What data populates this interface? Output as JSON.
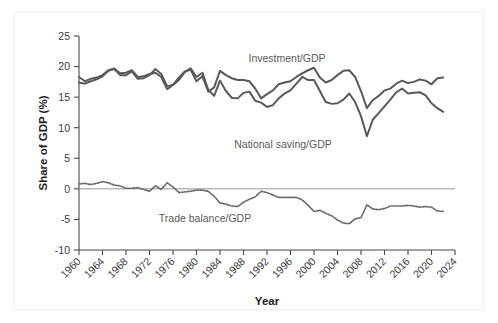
{
  "chart_data": {
    "type": "line",
    "title": "",
    "xlabel": "Year",
    "ylabel": "Share of GDP (%)",
    "xlim": [
      1960,
      2024
    ],
    "ylim": [
      -10,
      25
    ],
    "yticks": [
      -10,
      -5,
      0,
      5,
      10,
      15,
      20,
      25
    ],
    "ytick_labels": [
      "-10",
      "-5",
      "0",
      "5",
      "10",
      "15",
      "20",
      "25"
    ],
    "xticks": [
      1960,
      1964,
      1968,
      1972,
      1976,
      1980,
      1984,
      1988,
      1992,
      1996,
      2000,
      2004,
      2008,
      2012,
      2016,
      2020,
      2024
    ],
    "xtick_labels": [
      "1960",
      "1964",
      "1968",
      "1972",
      "1976",
      "1980",
      "1984",
      "1988",
      "1992",
      "1996",
      "2000",
      "2004",
      "2008",
      "2012",
      "2016",
      "2020",
      "2024"
    ],
    "grid": false,
    "legend": "inline-annotations",
    "zero_reference_line": 0,
    "x": [
      1960,
      1961,
      1962,
      1963,
      1964,
      1965,
      1966,
      1967,
      1968,
      1969,
      1970,
      1971,
      1972,
      1973,
      1974,
      1975,
      1976,
      1977,
      1978,
      1979,
      1980,
      1981,
      1982,
      1983,
      1984,
      1985,
      1986,
      1987,
      1988,
      1989,
      1990,
      1991,
      1992,
      1993,
      1994,
      1995,
      1996,
      1997,
      1998,
      1999,
      2000,
      2001,
      2002,
      2003,
      2004,
      2005,
      2006,
      2007,
      2008,
      2009,
      2010,
      2011,
      2012,
      2013,
      2014,
      2015,
      2016,
      2017,
      2018,
      2019,
      2020,
      2021,
      2022
    ],
    "series": [
      {
        "name": "Investment/GDP",
        "style": "solid",
        "color": "#595959",
        "values": [
          18.3,
          17.6,
          18.0,
          18.2,
          18.6,
          19.4,
          19.7,
          18.9,
          19.0,
          19.4,
          18.3,
          18.4,
          18.8,
          19.0,
          18.3,
          16.3,
          17.0,
          18.2,
          19.2,
          19.5,
          17.6,
          18.4,
          15.9,
          16.6,
          19.3,
          18.6,
          18.1,
          17.8,
          17.8,
          17.6,
          16.4,
          14.8,
          15.5,
          16.1,
          17.1,
          17.4,
          17.6,
          18.3,
          18.9,
          19.4,
          19.8,
          18.2,
          17.4,
          17.8,
          18.6,
          19.3,
          19.4,
          18.3,
          16.0,
          13.2,
          14.5,
          15.2,
          16.1,
          16.4,
          17.2,
          17.7,
          17.3,
          17.5,
          17.9,
          17.7,
          17.1,
          18.1,
          18.2
        ]
      },
      {
        "name": "National saving/GDP",
        "style": "solid",
        "color": "#595959",
        "values": [
          17.4,
          17.2,
          17.6,
          17.9,
          18.4,
          19.3,
          19.6,
          18.6,
          18.6,
          19.2,
          18.0,
          18.1,
          18.6,
          19.6,
          18.8,
          16.8,
          17.0,
          17.8,
          19.1,
          19.7,
          18.3,
          19.0,
          16.2,
          15.2,
          17.7,
          16.0,
          14.9,
          14.8,
          15.7,
          15.9,
          14.4,
          14.1,
          13.4,
          13.7,
          14.8,
          15.6,
          16.1,
          17.2,
          18.3,
          17.8,
          17.8,
          16.0,
          14.2,
          13.9,
          14.0,
          14.6,
          15.6,
          14.2,
          11.9,
          8.6,
          11.3,
          12.4,
          13.5,
          14.6,
          15.8,
          16.4,
          15.6,
          15.7,
          15.8,
          15.3,
          14.0,
          13.2,
          12.6
        ]
      },
      {
        "name": "Trade balance/GDP",
        "style": "dotted",
        "color": "#6b6b6b",
        "values": [
          0.8,
          0.9,
          0.7,
          0.9,
          1.2,
          1.0,
          0.6,
          0.5,
          0.1,
          0.1,
          0.2,
          -0.1,
          -0.4,
          0.5,
          -0.1,
          1.0,
          0.3,
          -0.6,
          -0.5,
          -0.4,
          -0.2,
          -0.2,
          -0.4,
          -1.2,
          -2.3,
          -2.5,
          -2.8,
          -2.9,
          -2.2,
          -1.7,
          -1.3,
          -0.4,
          -0.6,
          -1.0,
          -1.4,
          -1.4,
          -1.4,
          -1.4,
          -1.8,
          -2.7,
          -3.7,
          -3.5,
          -4.0,
          -4.4,
          -5.1,
          -5.6,
          -5.7,
          -4.9,
          -4.7,
          -2.6,
          -3.3,
          -3.4,
          -3.2,
          -2.8,
          -2.8,
          -2.8,
          -2.7,
          -2.8,
          -3.0,
          -2.9,
          -3.0,
          -3.6,
          -3.7
        ]
      }
    ],
    "annotations": [
      {
        "text": "Investment/GDP",
        "x_px": 287,
        "y_px": 62
      },
      {
        "text": "National saving/GDP",
        "x_px": 283,
        "y_px": 148
      },
      {
        "text": "Trade balance/GDP",
        "x_px": 205,
        "y_px": 222
      }
    ]
  }
}
